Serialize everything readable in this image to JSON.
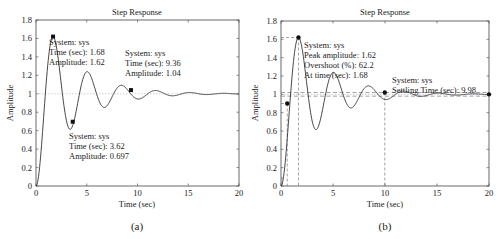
{
  "chart_data": [
    {
      "type": "line",
      "panel": "a",
      "title": "Step Response",
      "xlabel": "Time (sec)",
      "ylabel": "Amplitude",
      "caption": "(a)",
      "xlim": [
        0,
        20
      ],
      "ylim": [
        0,
        1.8
      ],
      "xticks": [
        "0",
        "5",
        "10",
        "15",
        "20"
      ],
      "yticks": [
        "0",
        "0.2",
        "0.4",
        "0.6",
        "0.8",
        "1",
        "1.2",
        "1.4",
        "1.6",
        "1.8"
      ],
      "grid": false,
      "series": [
        {
          "name": "sys",
          "model": "second-order step response",
          "final_value": 1.0,
          "zeta": 0.15,
          "wn": 1.89
        }
      ],
      "reference_line": {
        "y": 1.0,
        "style": "dotted"
      },
      "annotations": [
        {
          "x": 1.68,
          "y": 1.62,
          "lines": [
            "System: sys",
            "Time (sec): 1.68",
            "Amplitude: 1.62"
          ]
        },
        {
          "x": 3.62,
          "y": 0.697,
          "lines": [
            "System: sys",
            "Time (sec): 3.62",
            "Amplitude: 0.697"
          ]
        },
        {
          "x": 9.36,
          "y": 1.04,
          "lines": [
            "System: sys",
            "Time (sec): 9.36",
            "Amplitude: 1.04"
          ]
        }
      ]
    },
    {
      "type": "line",
      "panel": "b",
      "title": "Step Response",
      "xlabel": "Time (sec)",
      "ylabel": "Amplitude",
      "caption": "(b)",
      "xlim": [
        0,
        20
      ],
      "ylim": [
        0,
        1.8
      ],
      "xticks": [
        "0",
        "5",
        "10",
        "15",
        "20"
      ],
      "yticks": [
        "0",
        "0.2",
        "0.4",
        "0.6",
        "0.8",
        "1",
        "1.2",
        "1.4",
        "1.6",
        "1.8"
      ],
      "grid": false,
      "series": [
        {
          "name": "sys",
          "model": "second-order step response",
          "final_value": 1.0,
          "zeta": 0.15,
          "wn": 1.89
        }
      ],
      "settling_band": [
        0.98,
        1.02
      ],
      "characteristics": {
        "rise_time_marker": {
          "x": 0.6,
          "y": 0.9
        },
        "peak": {
          "x": 1.68,
          "y": 1.62
        },
        "settling": {
          "x": 9.98,
          "y": 1.02
        },
        "steady_state": {
          "x": 20,
          "y": 1.0
        }
      },
      "annotations": [
        {
          "x": 1.68,
          "y": 1.62,
          "lines": [
            "System: sys",
            "Peak amplitude: 1.62",
            "Overshoot (%): 62.2",
            "At time (sec): 1.68"
          ]
        },
        {
          "x": 9.98,
          "y": 1.02,
          "lines": [
            "System: sys",
            "Settling Time (sec): 9.98"
          ]
        }
      ]
    }
  ]
}
